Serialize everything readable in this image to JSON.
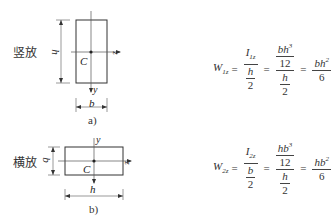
{
  "figure_a": {
    "orientation_label": "竖放",
    "dim_height": "h",
    "dim_width": "b",
    "centroid": "C",
    "axis_z": "z",
    "axis_y": "y",
    "caption": "a)"
  },
  "figure_b": {
    "orientation_label": "横放",
    "dim_height": "b",
    "dim_width": "h",
    "centroid": "C",
    "axis_z": "z",
    "axis_y": "y",
    "caption": "b)"
  },
  "formula_1": {
    "lhs": "W",
    "lhs_sub": "1z",
    "eq": "=",
    "f1_num": "I",
    "f1_num_sub": "1z",
    "f1_den_num": "h",
    "f1_den_den": "2",
    "f2_top_num": "bh",
    "f2_top_sup": "3",
    "f2_top_den": "12",
    "f2_bot_num": "h",
    "f2_bot_den": "2",
    "res_num": "bh",
    "res_sup": "2",
    "res_den": "6"
  },
  "formula_2": {
    "lhs": "W",
    "lhs_sub": "2z",
    "eq": "=",
    "f1_num": "I",
    "f1_num_sub": "2z",
    "f1_den_num": "b",
    "f1_den_den": "2",
    "f2_top_num": "hb",
    "f2_top_sup": "3",
    "f2_top_den": "12",
    "f2_bot_num": "h",
    "f2_bot_den": "2",
    "res_num": "hb",
    "res_sup": "2",
    "res_den": "6"
  }
}
